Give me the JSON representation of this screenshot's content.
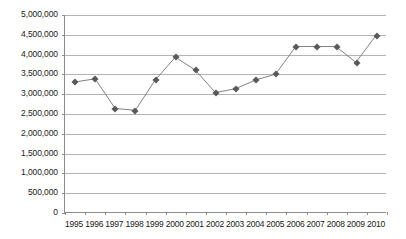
{
  "chart_data": {
    "type": "line",
    "title": "",
    "subtitle": "",
    "xlabel": "",
    "ylabel": "",
    "categories": [
      "1995",
      "1996",
      "1997",
      "1998",
      "1999",
      "2000",
      "2001",
      "2002",
      "2003",
      "2004",
      "2005",
      "2006",
      "2007",
      "2008",
      "2009",
      "2010"
    ],
    "values": [
      3300000,
      3380000,
      2630000,
      2580000,
      3350000,
      3930000,
      3600000,
      3030000,
      3130000,
      3350000,
      3500000,
      4200000,
      4200000,
      4200000,
      3800000,
      4480000
    ],
    "series": [
      {
        "name": "",
        "values": [
          3300000,
          3380000,
          2630000,
          2580000,
          3350000,
          3930000,
          3600000,
          3030000,
          3130000,
          3350000,
          3500000,
          4200000,
          4200000,
          4200000,
          3800000,
          4480000
        ]
      }
    ],
    "ylim": [
      0,
      5000000
    ],
    "ytick_values": [
      0,
      500000,
      1000000,
      1500000,
      2000000,
      2500000,
      3000000,
      3500000,
      4000000,
      4500000,
      5000000
    ],
    "ytick_labels": [
      "0",
      "500,000",
      "1,000,000",
      "1,500,000",
      "2,000,000",
      "2,500,000",
      "3,000,000",
      "3,500,000",
      "4,000,000",
      "4,500,000",
      "5,000,000"
    ],
    "grid": true,
    "grid_axis": "y",
    "legend": false,
    "legend_position": "none",
    "marker": "diamond",
    "annotations": [],
    "colors": {
      "line": "#808080",
      "marker": "#595959",
      "gridline": "#b3b3b3",
      "axis": "#8c8c8c",
      "text": "#1a1a1a",
      "background": "#ffffff"
    }
  }
}
